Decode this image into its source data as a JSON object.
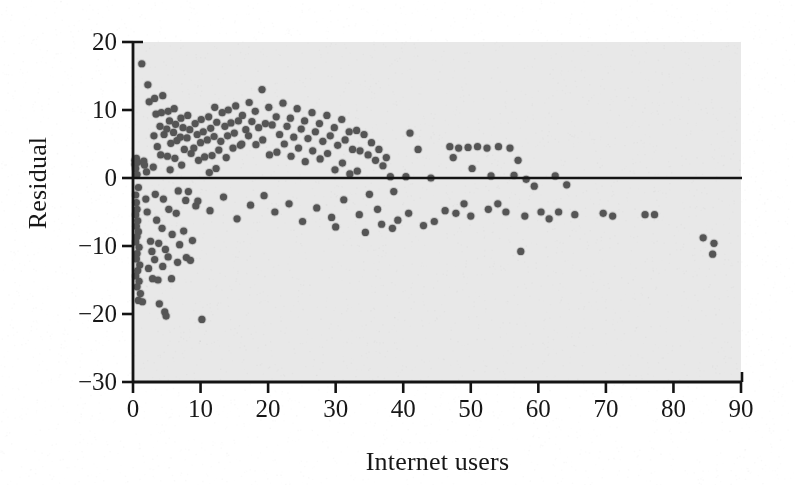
{
  "figure": {
    "kind": "residual-scatterplot",
    "background_color": "#ffffff",
    "plot_area_color": "#e8e8e8",
    "point_color": "#555555",
    "axis_color": "#141414",
    "reference_line_color": "#141414"
  },
  "axis_labels": {
    "x": "Internet users",
    "y": "Residual"
  },
  "ticks": {
    "x": [
      "0",
      "10",
      "20",
      "30",
      "40",
      "50",
      "60",
      "70",
      "80",
      "90"
    ],
    "y": [
      "20",
      "10",
      "0",
      "−10",
      "−20",
      "−30"
    ]
  },
  "chart_data": {
    "type": "scatter",
    "title": "",
    "xlabel": "Internet users",
    "ylabel": "Residual",
    "xlim": [
      0,
      90
    ],
    "ylim": [
      -30,
      20
    ],
    "xticks": [
      0,
      10,
      20,
      30,
      40,
      50,
      60,
      70,
      80,
      90
    ],
    "yticks": [
      20,
      10,
      0,
      -10,
      -20,
      -30
    ],
    "grid": false,
    "legend": null,
    "reference_line": {
      "type": "horizontal",
      "y": 0,
      "label": ""
    },
    "marker": {
      "shape": "circle",
      "size_px": 7,
      "color": "#555555"
    },
    "points": [
      [
        0.3,
        2.6
      ],
      [
        0.3,
        2.0
      ],
      [
        0.4,
        1.4
      ],
      [
        0.5,
        2.9
      ],
      [
        0.6,
        0.5
      ],
      [
        0.7,
        2.3
      ],
      [
        0.8,
        -1.4
      ],
      [
        0.4,
        -2.5
      ],
      [
        0.5,
        -3.6
      ],
      [
        0.6,
        -4.6
      ],
      [
        0.4,
        -5.4
      ],
      [
        0.7,
        -6.3
      ],
      [
        0.5,
        -7.1
      ],
      [
        0.8,
        -7.9
      ],
      [
        0.6,
        -8.6
      ],
      [
        0.4,
        -9.4
      ],
      [
        0.9,
        -10.2
      ],
      [
        0.6,
        -11.1
      ],
      [
        0.5,
        -11.9
      ],
      [
        1.0,
        -12.8
      ],
      [
        0.7,
        -13.6
      ],
      [
        0.4,
        -14.4
      ],
      [
        0.9,
        -15.2
      ],
      [
        0.6,
        -16.0
      ],
      [
        1.1,
        -17.0
      ],
      [
        0.8,
        -18.0
      ],
      [
        1.4,
        -18.2
      ],
      [
        1.3,
        16.8
      ],
      [
        1.6,
        2.5
      ],
      [
        1.7,
        1.9
      ],
      [
        1.9,
        -3.1
      ],
      [
        2.1,
        -5.0
      ],
      [
        2.2,
        13.7
      ],
      [
        2.4,
        11.2
      ],
      [
        2.0,
        0.9
      ],
      [
        2.6,
        -9.3
      ],
      [
        2.8,
        -10.8
      ],
      [
        2.3,
        -13.3
      ],
      [
        2.9,
        -14.8
      ],
      [
        3.2,
        11.7
      ],
      [
        3.4,
        9.4
      ],
      [
        3.1,
        6.2
      ],
      [
        3.6,
        4.6
      ],
      [
        3.0,
        1.6
      ],
      [
        3.3,
        -2.4
      ],
      [
        3.5,
        -6.2
      ],
      [
        3.8,
        -9.6
      ],
      [
        3.2,
        -12.0
      ],
      [
        3.7,
        -15.0
      ],
      [
        3.9,
        -18.5
      ],
      [
        4.2,
        9.6
      ],
      [
        4.4,
        12.1
      ],
      [
        4.0,
        7.6
      ],
      [
        4.6,
        6.4
      ],
      [
        4.1,
        3.4
      ],
      [
        4.5,
        -3.1
      ],
      [
        4.3,
        -7.4
      ],
      [
        4.8,
        -10.5
      ],
      [
        4.4,
        -13.0
      ],
      [
        4.7,
        -19.7
      ],
      [
        4.9,
        -20.3
      ],
      [
        5.2,
        9.8
      ],
      [
        5.4,
        8.4
      ],
      [
        5.0,
        7.2
      ],
      [
        5.6,
        5.1
      ],
      [
        5.1,
        3.2
      ],
      [
        5.5,
        1.2
      ],
      [
        5.3,
        -4.6
      ],
      [
        5.8,
        -8.3
      ],
      [
        5.2,
        -11.6
      ],
      [
        5.7,
        -14.8
      ],
      [
        6.1,
        10.2
      ],
      [
        6.3,
        7.9
      ],
      [
        6.0,
        6.7
      ],
      [
        6.5,
        5.5
      ],
      [
        6.2,
        2.9
      ],
      [
        6.7,
        -1.9
      ],
      [
        6.4,
        -5.2
      ],
      [
        6.9,
        -9.8
      ],
      [
        6.6,
        -12.4
      ],
      [
        7.1,
        8.8
      ],
      [
        7.4,
        7.4
      ],
      [
        7.0,
        6.0
      ],
      [
        7.6,
        4.2
      ],
      [
        7.2,
        1.9
      ],
      [
        7.8,
        -3.3
      ],
      [
        7.5,
        -7.8
      ],
      [
        7.9,
        -11.7
      ],
      [
        8.1,
        9.2
      ],
      [
        8.4,
        7.1
      ],
      [
        8.0,
        5.9
      ],
      [
        8.6,
        3.6
      ],
      [
        8.2,
        -2.0
      ],
      [
        8.8,
        -9.2
      ],
      [
        8.5,
        -12.1
      ],
      [
        9.2,
        8.0
      ],
      [
        9.5,
        6.4
      ],
      [
        9.0,
        4.4
      ],
      [
        9.7,
        2.6
      ],
      [
        9.3,
        -4.1
      ],
      [
        10.1,
        8.6
      ],
      [
        10.4,
        6.8
      ],
      [
        10.0,
        5.2
      ],
      [
        10.6,
        3.1
      ],
      [
        10.2,
        -20.8
      ],
      [
        11.2,
        9.0
      ],
      [
        11.5,
        7.3
      ],
      [
        11.0,
        5.6
      ],
      [
        11.7,
        3.3
      ],
      [
        11.3,
        0.8
      ],
      [
        12.1,
        10.4
      ],
      [
        12.4,
        8.2
      ],
      [
        12.0,
        6.1
      ],
      [
        12.7,
        4.1
      ],
      [
        12.3,
        1.4
      ],
      [
        13.2,
        9.6
      ],
      [
        13.6,
        7.6
      ],
      [
        13.0,
        5.4
      ],
      [
        13.8,
        3.0
      ],
      [
        14.1,
        10.0
      ],
      [
        14.5,
        8.1
      ],
      [
        14.0,
        6.2
      ],
      [
        14.8,
        4.4
      ],
      [
        15.2,
        10.6
      ],
      [
        15.6,
        8.4
      ],
      [
        15.0,
        6.6
      ],
      [
        15.9,
        4.8
      ],
      [
        16.2,
        9.2
      ],
      [
        16.7,
        7.1
      ],
      [
        16.1,
        5.0
      ],
      [
        17.2,
        11.1
      ],
      [
        17.6,
        8.3
      ],
      [
        17.1,
        6.2
      ],
      [
        18.1,
        9.8
      ],
      [
        18.6,
        7.4
      ],
      [
        18.2,
        4.9
      ],
      [
        19.1,
        13.0
      ],
      [
        19.6,
        8.0
      ],
      [
        19.2,
        5.6
      ],
      [
        20.1,
        10.4
      ],
      [
        20.6,
        7.8
      ],
      [
        20.2,
        3.4
      ],
      [
        21.2,
        9.0
      ],
      [
        21.7,
        6.4
      ],
      [
        21.3,
        3.8
      ],
      [
        22.2,
        11.0
      ],
      [
        22.8,
        7.6
      ],
      [
        22.4,
        5.0
      ],
      [
        23.3,
        8.8
      ],
      [
        23.8,
        6.0
      ],
      [
        23.4,
        3.2
      ],
      [
        24.3,
        10.2
      ],
      [
        24.9,
        7.2
      ],
      [
        24.5,
        4.4
      ],
      [
        25.4,
        8.4
      ],
      [
        25.9,
        5.8
      ],
      [
        25.5,
        2.4
      ],
      [
        26.5,
        9.6
      ],
      [
        27.0,
        6.8
      ],
      [
        26.6,
        4.0
      ],
      [
        27.6,
        8.0
      ],
      [
        28.1,
        5.4
      ],
      [
        27.7,
        2.8
      ],
      [
        28.7,
        9.2
      ],
      [
        29.2,
        6.2
      ],
      [
        28.8,
        3.6
      ],
      [
        29.8,
        7.4
      ],
      [
        30.3,
        4.8
      ],
      [
        29.9,
        1.2
      ],
      [
        30.9,
        8.6
      ],
      [
        31.4,
        5.6
      ],
      [
        31.0,
        2.2
      ],
      [
        32.0,
        6.8
      ],
      [
        32.5,
        4.2
      ],
      [
        32.1,
        0.6
      ],
      [
        33.1,
        7.0
      ],
      [
        33.6,
        4.0
      ],
      [
        33.2,
        1.0
      ],
      [
        34.2,
        6.4
      ],
      [
        34.8,
        3.4
      ],
      [
        35.3,
        5.2
      ],
      [
        35.9,
        2.6
      ],
      [
        36.4,
        4.2
      ],
      [
        37.0,
        1.8
      ],
      [
        37.5,
        3.0
      ],
      [
        38.1,
        0.2
      ],
      [
        38.6,
        -2.0
      ],
      [
        35.0,
        -2.4
      ],
      [
        36.2,
        -4.6
      ],
      [
        33.5,
        -5.4
      ],
      [
        31.2,
        -3.2
      ],
      [
        29.4,
        -5.8
      ],
      [
        27.2,
        -4.4
      ],
      [
        25.1,
        -6.4
      ],
      [
        23.1,
        -3.8
      ],
      [
        21.0,
        -5.0
      ],
      [
        19.4,
        -2.6
      ],
      [
        17.4,
        -4.0
      ],
      [
        15.4,
        -6.0
      ],
      [
        13.4,
        -2.8
      ],
      [
        11.4,
        -4.8
      ],
      [
        9.6,
        -3.4
      ],
      [
        41.0,
        6.6
      ],
      [
        42.2,
        4.2
      ],
      [
        40.4,
        0.2
      ],
      [
        44.1,
        0.0
      ],
      [
        46.9,
        4.6
      ],
      [
        48.2,
        4.4
      ],
      [
        47.4,
        3.0
      ],
      [
        49.6,
        4.5
      ],
      [
        51.0,
        4.6
      ],
      [
        52.4,
        4.4
      ],
      [
        54.1,
        4.6
      ],
      [
        55.8,
        4.4
      ],
      [
        50.2,
        1.4
      ],
      [
        53.0,
        0.3
      ],
      [
        56.4,
        0.4
      ],
      [
        57.0,
        2.6
      ],
      [
        58.2,
        -0.2
      ],
      [
        59.4,
        -1.2
      ],
      [
        62.5,
        0.3
      ],
      [
        64.2,
        -1.0
      ],
      [
        46.2,
        -4.8
      ],
      [
        47.8,
        -5.2
      ],
      [
        50.0,
        -5.6
      ],
      [
        49.0,
        -3.8
      ],
      [
        52.6,
        -4.6
      ],
      [
        55.2,
        -5.0
      ],
      [
        54.0,
        -3.8
      ],
      [
        57.4,
        -10.8
      ],
      [
        58.0,
        -5.6
      ],
      [
        63.0,
        -5.0
      ],
      [
        65.4,
        -5.4
      ],
      [
        69.6,
        -5.2
      ],
      [
        71.0,
        -5.6
      ],
      [
        75.8,
        -5.4
      ],
      [
        77.2,
        -5.4
      ],
      [
        84.4,
        -8.8
      ],
      [
        85.8,
        -11.2
      ],
      [
        86.0,
        -9.6
      ],
      [
        60.4,
        -5.0
      ],
      [
        61.6,
        -6.0
      ],
      [
        44.6,
        -6.4
      ],
      [
        43.0,
        -7.0
      ],
      [
        40.8,
        -5.2
      ],
      [
        39.2,
        -6.2
      ],
      [
        38.4,
        -7.4
      ],
      [
        36.8,
        -6.8
      ],
      [
        34.4,
        -8.0
      ],
      [
        30.0,
        -7.2
      ]
    ]
  }
}
